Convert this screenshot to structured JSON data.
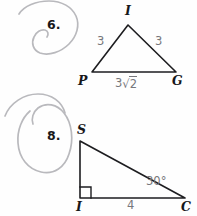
{
  "page": {
    "background_color": "#fefefe",
    "width": 197,
    "height": 216,
    "ink_color": "#17171a",
    "label_color": "#77777c",
    "scribble_color": "#b9b9bd"
  },
  "problems": [
    {
      "number": "6.",
      "shape": "isosceles-triangle",
      "vertices": [
        {
          "name": "I",
          "label": "I",
          "x": 128,
          "y": 25
        },
        {
          "name": "P",
          "label": "P",
          "x": 92,
          "y": 72
        },
        {
          "name": "G",
          "label": "G",
          "x": 176,
          "y": 72
        }
      ],
      "side_labels": [
        {
          "name": "side-PI",
          "text": "3"
        },
        {
          "name": "side-IG",
          "text": "3"
        },
        {
          "name": "side-PG",
          "text": "3√2",
          "radicand": "2",
          "coefficient": "3"
        }
      ]
    },
    {
      "number": "8.",
      "shape": "right-triangle",
      "vertices": [
        {
          "name": "S",
          "label": "S",
          "x": 80,
          "y": 141
        },
        {
          "name": "I",
          "label": "I",
          "x": 80,
          "y": 198
        },
        {
          "name": "C",
          "label": "C",
          "x": 185,
          "y": 198
        }
      ],
      "angle_labels": [
        {
          "name": "angle-C",
          "text": "30°"
        }
      ],
      "side_labels": [
        {
          "name": "side-IC",
          "text": "4"
        }
      ],
      "right_angle_at": "I"
    }
  ],
  "annotations": [
    {
      "name": "pencil-scribble-top",
      "type": "hand-drawn-loop"
    },
    {
      "name": "pencil-scribble-bottom",
      "type": "hand-drawn-loop"
    }
  ]
}
